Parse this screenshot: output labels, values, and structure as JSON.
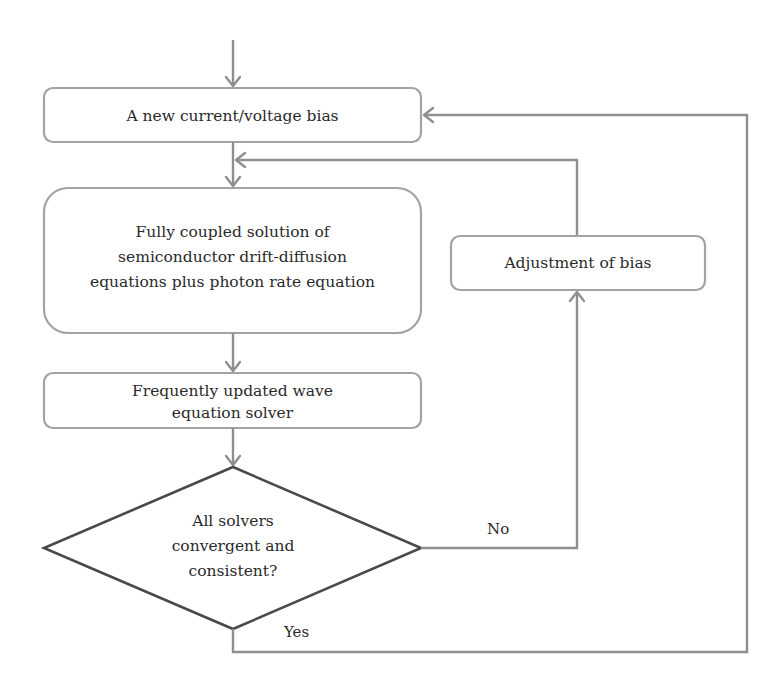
{
  "diagram": {
    "type": "flowchart",
    "nodes": {
      "bias": {
        "text": "A new current/voltage bias"
      },
      "coupled": {
        "lines": [
          "Fully coupled solution of",
          "semiconductor drift-diffusion",
          "equations plus photon rate equation"
        ]
      },
      "wave": {
        "lines": [
          "Frequently updated wave",
          "equation solver"
        ]
      },
      "decision": {
        "lines": [
          "All solvers",
          "convergent and",
          "consistent?"
        ]
      },
      "adjust": {
        "text": "Adjustment of bias"
      }
    },
    "edge_labels": {
      "no": "No",
      "yes": "Yes"
    },
    "edges": [
      {
        "from": "start",
        "to": "bias"
      },
      {
        "from": "bias",
        "to": "coupled"
      },
      {
        "from": "coupled",
        "to": "wave"
      },
      {
        "from": "wave",
        "to": "decision"
      },
      {
        "from": "decision",
        "to": "adjust",
        "label": "No"
      },
      {
        "from": "adjust",
        "to": "coupled"
      },
      {
        "from": "decision",
        "to": "bias",
        "label": "Yes"
      }
    ],
    "colors": {
      "box_stroke": "#a3a3a3",
      "connector": "#8f8f8f",
      "diamond_stroke": "#4a4a4a",
      "text": "#2a2a2a"
    }
  }
}
